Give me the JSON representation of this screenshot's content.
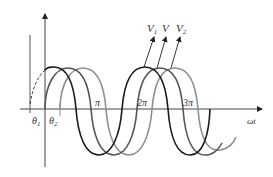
{
  "diagram": {
    "type": "phase-shifted sinusoids",
    "axes": {
      "x_label": "ωt",
      "y_axis_arrow": true
    },
    "tick_labels": [
      "π",
      "2π",
      "3π"
    ],
    "phase_labels": {
      "theta1": "θ",
      "theta1_sub": "1",
      "theta2": "θ",
      "theta2_sub": "2"
    },
    "curve_labels": {
      "v1": "V",
      "v1_sub": "1",
      "v": "V",
      "v2": "V",
      "v2_sub": "2"
    },
    "curves": [
      {
        "name": "V1",
        "color": "#1a1a1a",
        "phase": "leading by θ1"
      },
      {
        "name": "V",
        "color": "#555555",
        "phase": "reference"
      },
      {
        "name": "V2",
        "color": "#8f8f8f",
        "phase": "lagging by θ2"
      }
    ]
  }
}
